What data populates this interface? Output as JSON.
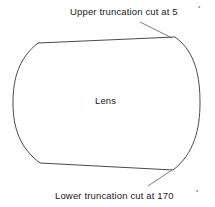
{
  "diagram": {
    "title_upper": "Upper truncation cut at 5",
    "upper_degree_symbol": "°",
    "title_lower": "Lower truncation cut at 170",
    "lower_degree_symbol": "°",
    "center_label": "Lens",
    "upper_angle_value": "5",
    "lower_angle_value": "170",
    "stroke_color": "#4a4a4a",
    "leader_color": "#6e6e6e",
    "fill_color": "#ffffff",
    "text_color": "#1a1a1a",
    "shape": {
      "name": "truncated-lens-outline",
      "top_left_vertex": "38,43",
      "top_right_vertex": "175,37",
      "bottom_right_vertex": "173,170",
      "bottom_left_vertex": "40,163",
      "left_arc_extremity_x": "13",
      "right_arc_extremity_x": "200"
    }
  }
}
